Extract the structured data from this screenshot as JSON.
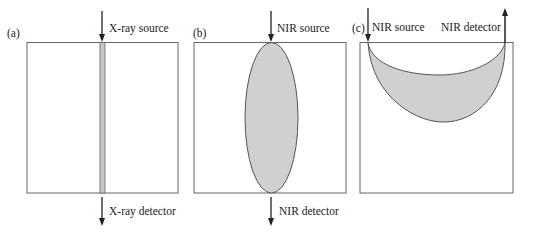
{
  "colors": {
    "stroke": "#555555",
    "fill": "#d0d0d0",
    "arrow": "#222222",
    "text": "#222222"
  },
  "panels": [
    {
      "id": "a",
      "label": "(a)",
      "source_label": "X-ray source",
      "detector_label": "X-ray detector",
      "region_shape": "vertical-strip"
    },
    {
      "id": "b",
      "label": "(b)",
      "source_label": "NIR source",
      "detector_label": "NIR detector",
      "region_shape": "ellipse"
    },
    {
      "id": "c",
      "label": "(c)",
      "source_label": "NIR source",
      "detector_label": "NIR detector",
      "region_shape": "banana"
    }
  ]
}
